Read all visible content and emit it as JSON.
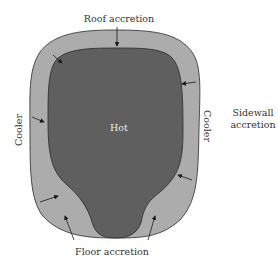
{
  "diagram": {
    "labels": {
      "roof": "Roof accretion",
      "hot": "Hot",
      "cooler_left": "Cooler",
      "cooler_right": "Cooler",
      "sidewall_line1": "Sidewall",
      "sidewall_line2": "accretion",
      "floor": "Floor accretion"
    },
    "colors": {
      "hot_core": "#5f5f5f",
      "accretion_layer": "#acacac",
      "outline": "#2a2a2a",
      "text": "#333333"
    }
  }
}
